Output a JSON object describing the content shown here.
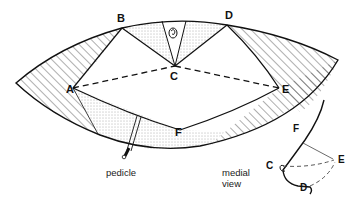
{
  "figure": {
    "type": "surgical diagram",
    "colors": {
      "line": "#111111",
      "hatch": "#333333",
      "dots": "#555555",
      "background": "#ffffff"
    }
  },
  "main_view": {
    "points": [
      {
        "id": "A",
        "label": "A"
      },
      {
        "id": "B",
        "label": "B"
      },
      {
        "id": "C",
        "label": "C"
      },
      {
        "id": "D",
        "label": "D"
      },
      {
        "id": "E",
        "label": "E"
      },
      {
        "id": "F",
        "label": "F"
      }
    ],
    "pedicle_label": "pedicle"
  },
  "medial_view": {
    "caption_line1": "medial",
    "caption_line2": "view",
    "points": [
      {
        "id": "F",
        "label": "F"
      },
      {
        "id": "C",
        "label": "C"
      },
      {
        "id": "E",
        "label": "E"
      },
      {
        "id": "D",
        "label": "D"
      }
    ]
  }
}
